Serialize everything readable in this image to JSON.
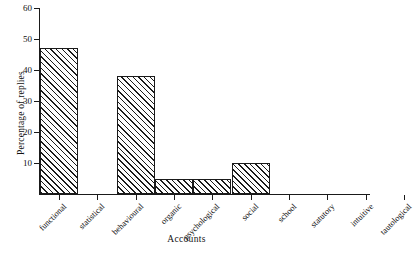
{
  "chart_data": {
    "type": "bar",
    "title": "",
    "xlabel": "Accounts",
    "ylabel": "Percentage of replies",
    "categories": [
      "functional",
      "statistical",
      "behavioural",
      "organic",
      "psychological",
      "social",
      "school",
      "statutory",
      "intuitive",
      "tautological"
    ],
    "values": [
      47,
      0,
      38,
      5,
      5,
      10,
      0,
      0,
      0,
      0
    ],
    "ylim": [
      0,
      60
    ],
    "yticks": [
      10,
      20,
      30,
      40,
      50,
      60
    ],
    "ytick_labels": [
      "10",
      "20",
      "30",
      "40",
      "50",
      "60"
    ],
    "grid": false,
    "legend": null,
    "bar_style": {
      "fill": "diagonal-hatch",
      "edge_color": "#1a1a1a",
      "face_color": "#ffffff"
    }
  },
  "axes": {
    "y_title": "Percentage of replies",
    "x_title": "Accounts"
  }
}
